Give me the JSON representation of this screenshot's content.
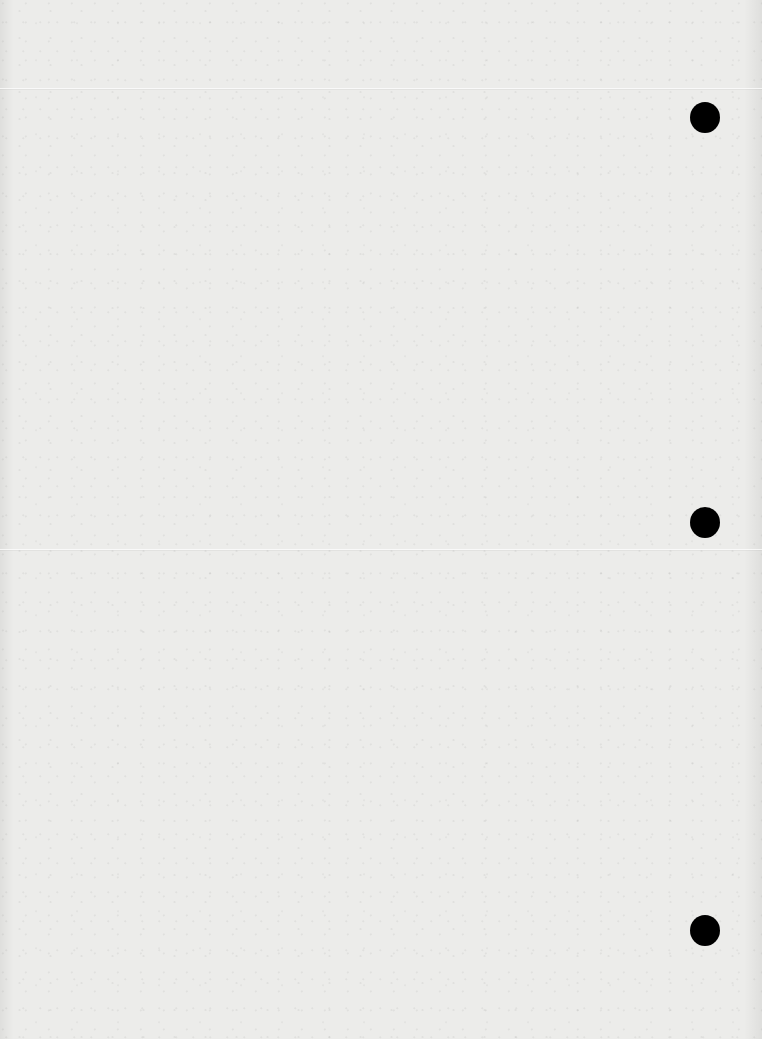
{
  "page": {
    "type": "blank-paper-sheet",
    "background_color": "#ececea",
    "text_content": ""
  },
  "punch_holes": [
    {
      "x": 690,
      "y": 102,
      "color": "#000000"
    },
    {
      "x": 690,
      "y": 507,
      "color": "#000000"
    },
    {
      "x": 690,
      "y": 915,
      "color": "#000000"
    }
  ],
  "fold_lines": [
    {
      "y": 88
    },
    {
      "y": 549
    }
  ]
}
